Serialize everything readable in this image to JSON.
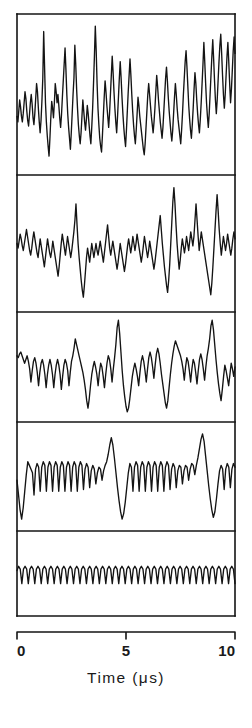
{
  "figure": {
    "background_color": "#ffffff",
    "ink_color": "#141414",
    "plot_left_px": 17,
    "plot_right_px": 235,
    "panel_edges_px": [
      14,
      175,
      312,
      422,
      531,
      616
    ],
    "border_width_px": 1.6,
    "trace_width_px": 1.35
  },
  "axis": {
    "label": "Time (μs)",
    "unit": "μs",
    "quantity": "Time",
    "tick_labels": [
      "0",
      "5",
      "10"
    ],
    "tick_values": [
      0,
      5,
      10
    ],
    "range": [
      0,
      10
    ],
    "axis_line_y_px": 632,
    "tick_direction": "down",
    "tick_length_px": 7,
    "label_y_px": 683
  },
  "panels": [
    {
      "index": 1,
      "name": "panel-1-noisy-broadband",
      "description": "Dense broadband noise with many tall narrow spikes",
      "top_px": 14,
      "bottom_px": 175,
      "baseline_frac": 0.62,
      "spike_count": 26
    },
    {
      "index": 2,
      "name": "panel-2-noisy-with-spikes",
      "description": "Noisy baseline with several prominent upward spikes",
      "top_px": 175,
      "bottom_px": 312,
      "baseline_frac": 0.55,
      "spike_count": 6
    },
    {
      "index": 3,
      "name": "panel-3-semi-periodic",
      "description": "Semi-periodic bursts with sharp downward excursions",
      "top_px": 312,
      "bottom_px": 422,
      "baseline_frac": 0.42,
      "spike_count": 4
    },
    {
      "index": 4,
      "name": "panel-4-comb-with-transients",
      "description": "Regular comb oscillation interrupted by two large transients",
      "top_px": 422,
      "bottom_px": 531,
      "baseline_frac": 0.5,
      "spike_count": 2
    },
    {
      "index": 5,
      "name": "panel-5-regular-comb",
      "description": "Clean uniform periodic comb / sawtooth train",
      "top_px": 531,
      "bottom_px": 616,
      "baseline_frac": 0.5,
      "spike_count": 0
    }
  ],
  "chart_data": {
    "type": "line",
    "title": "",
    "xlabel": "Time (μs)",
    "ylabel": "",
    "xlim": [
      0,
      10
    ],
    "xticks": [
      0,
      5,
      10
    ],
    "xticklabels": [
      "0",
      "5",
      "10"
    ],
    "grid": false,
    "legend": "none",
    "n_panels": 5,
    "panel_layout": "vertical-stack-shared-x",
    "series": [
      {
        "name": "panel 1 — broadband noise",
        "ylim": [
          0,
          1
        ],
        "y": [
          0.34,
          0.3,
          0.38,
          0.46,
          0.41,
          0.34,
          0.3,
          0.36,
          0.44,
          0.52,
          0.47,
          0.38,
          0.31,
          0.27,
          0.35,
          0.44,
          0.5,
          0.43,
          0.33,
          0.28,
          0.36,
          0.47,
          0.58,
          0.52,
          0.4,
          0.3,
          0.22,
          0.31,
          0.45,
          0.62,
          0.96,
          0.7,
          0.44,
          0.3,
          0.2,
          0.12,
          0.05,
          0.18,
          0.33,
          0.45,
          0.4,
          0.33,
          0.44,
          0.58,
          0.52,
          0.44,
          0.5,
          0.42,
          0.33,
          0.26,
          0.35,
          0.48,
          0.6,
          0.72,
          0.84,
          0.68,
          0.5,
          0.36,
          0.26,
          0.18,
          0.1,
          0.22,
          0.36,
          0.5,
          0.62,
          0.86,
          0.72,
          0.54,
          0.4,
          0.28,
          0.2,
          0.14,
          0.22,
          0.34,
          0.46,
          0.38,
          0.3,
          0.24,
          0.32,
          0.42,
          0.36,
          0.28,
          0.2,
          0.14,
          0.26,
          0.4,
          0.58,
          0.78,
          1.0,
          0.82,
          0.58,
          0.4,
          0.28,
          0.18,
          0.12,
          0.08,
          0.2,
          0.34,
          0.48,
          0.6,
          0.52,
          0.42,
          0.34,
          0.26,
          0.36,
          0.5,
          0.64,
          0.78,
          0.66,
          0.52,
          0.4,
          0.3,
          0.22,
          0.34,
          0.48,
          0.62,
          0.74,
          0.62,
          0.48,
          0.36,
          0.26,
          0.18,
          0.12,
          0.24,
          0.38,
          0.52,
          0.64,
          0.76,
          0.64,
          0.5,
          0.38,
          0.28,
          0.2,
          0.14,
          0.24,
          0.36,
          0.48,
          0.42,
          0.34,
          0.28,
          0.22,
          0.16,
          0.1,
          0.06,
          0.14,
          0.26,
          0.38,
          0.5,
          0.58,
          0.5,
          0.42,
          0.34,
          0.28,
          0.22,
          0.3,
          0.4,
          0.52,
          0.64,
          0.56,
          0.46,
          0.38,
          0.3,
          0.24,
          0.18,
          0.26,
          0.38,
          0.5,
          0.62,
          0.7,
          0.6,
          0.48,
          0.38,
          0.3,
          0.22,
          0.16,
          0.24,
          0.36,
          0.48,
          0.58,
          0.5,
          0.4,
          0.32,
          0.26,
          0.2,
          0.14,
          0.24,
          0.36,
          0.5,
          0.62,
          0.74,
          0.82,
          0.7,
          0.56,
          0.42,
          0.32,
          0.24,
          0.18,
          0.28,
          0.4,
          0.54,
          0.66,
          0.58,
          0.46,
          0.36,
          0.28,
          0.22,
          0.32,
          0.44,
          0.58,
          0.72,
          0.88,
          0.74,
          0.58,
          0.44,
          0.34,
          0.26,
          0.36,
          0.5,
          0.64,
          0.78,
          0.9,
          0.76,
          0.6,
          0.46,
          0.36,
          0.46,
          0.6,
          0.74,
          0.86,
          0.94,
          0.8,
          0.64,
          0.5,
          0.4,
          0.5,
          0.64,
          0.78,
          0.88,
          0.74,
          0.58,
          0.44,
          0.54,
          0.68,
          0.82,
          0.92,
          0.8
        ]
      },
      {
        "name": "panel 2 — noisy with spikes",
        "ylim": [
          0,
          1
        ],
        "y": [
          0.5,
          0.46,
          0.52,
          0.58,
          0.54,
          0.48,
          0.44,
          0.5,
          0.56,
          0.62,
          0.56,
          0.5,
          0.44,
          0.4,
          0.46,
          0.54,
          0.6,
          0.54,
          0.48,
          0.42,
          0.38,
          0.46,
          0.54,
          0.48,
          0.42,
          0.36,
          0.3,
          0.38,
          0.46,
          0.54,
          0.48,
          0.42,
          0.38,
          0.44,
          0.52,
          0.46,
          0.4,
          0.34,
          0.28,
          0.22,
          0.3,
          0.4,
          0.5,
          0.58,
          0.52,
          0.46,
          0.4,
          0.48,
          0.56,
          0.5,
          0.44,
          0.38,
          0.44,
          0.52,
          0.6,
          0.7,
          0.84,
          0.66,
          0.5,
          0.38,
          0.28,
          0.18,
          0.1,
          0.04,
          0.14,
          0.26,
          0.38,
          0.46,
          0.4,
          0.34,
          0.42,
          0.5,
          0.44,
          0.38,
          0.44,
          0.5,
          0.44,
          0.4,
          0.46,
          0.52,
          0.46,
          0.4,
          0.34,
          0.42,
          0.5,
          0.58,
          0.66,
          0.56,
          0.46,
          0.4,
          0.46,
          0.52,
          0.46,
          0.4,
          0.34,
          0.28,
          0.34,
          0.42,
          0.5,
          0.44,
          0.38,
          0.32,
          0.26,
          0.32,
          0.4,
          0.48,
          0.54,
          0.48,
          0.42,
          0.48,
          0.56,
          0.5,
          0.44,
          0.5,
          0.58,
          0.52,
          0.46,
          0.4,
          0.34,
          0.4,
          0.48,
          0.56,
          0.5,
          0.44,
          0.38,
          0.44,
          0.52,
          0.46,
          0.4,
          0.34,
          0.28,
          0.34,
          0.42,
          0.5,
          0.58,
          0.66,
          0.74,
          0.62,
          0.5,
          0.4,
          0.3,
          0.22,
          0.14,
          0.08,
          0.18,
          0.32,
          0.5,
          0.68,
          0.86,
          0.98,
          0.84,
          0.66,
          0.5,
          0.38,
          0.28,
          0.36,
          0.46,
          0.54,
          0.48,
          0.42,
          0.48,
          0.56,
          0.5,
          0.44,
          0.52,
          0.6,
          0.54,
          0.48,
          0.56,
          0.7,
          0.84,
          0.7,
          0.56,
          0.44,
          0.52,
          0.6,
          0.54,
          0.48,
          0.42,
          0.36,
          0.3,
          0.24,
          0.18,
          0.12,
          0.06,
          0.16,
          0.3,
          0.46,
          0.62,
          0.78,
          0.92,
          0.78,
          0.62,
          0.5,
          0.4,
          0.48,
          0.56,
          0.5,
          0.44,
          0.5,
          0.58,
          0.52,
          0.46,
          0.4,
          0.46,
          0.54,
          0.6,
          0.54
        ]
      },
      {
        "name": "panel 3 — semi-periodic",
        "ylim": [
          0,
          1
        ],
        "y": [
          0.62,
          0.6,
          0.64,
          0.66,
          0.62,
          0.58,
          0.54,
          0.58,
          0.62,
          0.56,
          0.48,
          0.34,
          0.46,
          0.56,
          0.6,
          0.54,
          0.44,
          0.3,
          0.44,
          0.54,
          0.58,
          0.52,
          0.42,
          0.28,
          0.42,
          0.52,
          0.58,
          0.52,
          0.42,
          0.28,
          0.42,
          0.52,
          0.58,
          0.52,
          0.42,
          0.26,
          0.4,
          0.52,
          0.58,
          0.54,
          0.46,
          0.3,
          0.44,
          0.56,
          0.62,
          0.7,
          0.8,
          0.74,
          0.68,
          0.62,
          0.56,
          0.5,
          0.44,
          0.36,
          0.26,
          0.14,
          0.06,
          0.16,
          0.3,
          0.42,
          0.5,
          0.56,
          0.5,
          0.42,
          0.3,
          0.44,
          0.54,
          0.5,
          0.4,
          0.28,
          0.42,
          0.54,
          0.62,
          0.58,
          0.48,
          0.34,
          0.48,
          0.6,
          0.74,
          0.92,
          1.0,
          0.86,
          0.66,
          0.46,
          0.3,
          0.18,
          0.08,
          0.02,
          0.06,
          0.16,
          0.28,
          0.4,
          0.48,
          0.54,
          0.48,
          0.4,
          0.3,
          0.44,
          0.56,
          0.62,
          0.56,
          0.46,
          0.34,
          0.48,
          0.6,
          0.66,
          0.6,
          0.5,
          0.38,
          0.52,
          0.64,
          0.7,
          0.64,
          0.54,
          0.42,
          0.32,
          0.22,
          0.12,
          0.06,
          0.14,
          0.28,
          0.42,
          0.54,
          0.64,
          0.72,
          0.78,
          0.74,
          0.7,
          0.66,
          0.62,
          0.56,
          0.48,
          0.36,
          0.5,
          0.6,
          0.56,
          0.46,
          0.34,
          0.48,
          0.58,
          0.54,
          0.44,
          0.32,
          0.46,
          0.58,
          0.64,
          0.58,
          0.48,
          0.36,
          0.5,
          0.62,
          0.7,
          0.8,
          0.94,
          1.0,
          0.9,
          0.74,
          0.58,
          0.44,
          0.32,
          0.22,
          0.14,
          0.26,
          0.4,
          0.52,
          0.46,
          0.38,
          0.3,
          0.42,
          0.54,
          0.48,
          0.4,
          0.5
        ]
      },
      {
        "name": "panel 4 — comb with transients",
        "ylim": [
          0,
          1
        ],
        "y": [
          0.46,
          0.3,
          0.14,
          0.04,
          0.16,
          0.34,
          0.52,
          0.66,
          0.62,
          0.58,
          0.54,
          0.3,
          0.58,
          0.64,
          0.6,
          0.34,
          0.6,
          0.66,
          0.62,
          0.34,
          0.6,
          0.66,
          0.62,
          0.34,
          0.6,
          0.66,
          0.62,
          0.34,
          0.6,
          0.66,
          0.62,
          0.34,
          0.6,
          0.66,
          0.62,
          0.34,
          0.6,
          0.66,
          0.62,
          0.34,
          0.6,
          0.66,
          0.62,
          0.36,
          0.58,
          0.64,
          0.6,
          0.38,
          0.56,
          0.62,
          0.58,
          0.42,
          0.54,
          0.6,
          0.58,
          0.46,
          0.56,
          0.62,
          0.66,
          0.74,
          0.84,
          0.92,
          0.84,
          0.7,
          0.54,
          0.38,
          0.24,
          0.12,
          0.04,
          0.1,
          0.22,
          0.38,
          0.54,
          0.64,
          0.6,
          0.34,
          0.6,
          0.66,
          0.62,
          0.34,
          0.6,
          0.66,
          0.62,
          0.34,
          0.6,
          0.66,
          0.62,
          0.34,
          0.6,
          0.66,
          0.62,
          0.34,
          0.6,
          0.66,
          0.62,
          0.34,
          0.6,
          0.66,
          0.62,
          0.36,
          0.58,
          0.64,
          0.6,
          0.38,
          0.56,
          0.62,
          0.6,
          0.42,
          0.56,
          0.62,
          0.6,
          0.46,
          0.58,
          0.64,
          0.62,
          0.52,
          0.62,
          0.7,
          0.8,
          0.9,
          0.96,
          0.88,
          0.72,
          0.56,
          0.4,
          0.26,
          0.14,
          0.06,
          0.12,
          0.26,
          0.42,
          0.56,
          0.62,
          0.58,
          0.36,
          0.58,
          0.64,
          0.6,
          0.38,
          0.58,
          0.64,
          0.6
        ]
      },
      {
        "name": "panel 5 — regular comb",
        "ylim": [
          0,
          1
        ],
        "y": [
          0.54,
          0.6,
          0.56,
          0.36,
          0.56,
          0.6,
          0.56,
          0.36,
          0.56,
          0.6,
          0.56,
          0.36,
          0.56,
          0.6,
          0.56,
          0.36,
          0.56,
          0.6,
          0.56,
          0.36,
          0.56,
          0.6,
          0.56,
          0.36,
          0.56,
          0.6,
          0.56,
          0.36,
          0.56,
          0.6,
          0.56,
          0.36,
          0.56,
          0.6,
          0.56,
          0.36,
          0.56,
          0.6,
          0.56,
          0.36,
          0.56,
          0.6,
          0.56,
          0.36,
          0.56,
          0.6,
          0.56,
          0.36,
          0.56,
          0.6,
          0.56,
          0.36,
          0.56,
          0.6,
          0.56,
          0.36,
          0.56,
          0.6,
          0.56,
          0.36,
          0.56,
          0.6,
          0.56,
          0.36,
          0.56,
          0.6,
          0.56,
          0.36,
          0.56,
          0.6,
          0.56,
          0.36,
          0.56,
          0.6,
          0.56,
          0.36,
          0.56,
          0.6,
          0.56,
          0.36,
          0.56,
          0.6,
          0.56,
          0.36,
          0.56,
          0.6,
          0.56,
          0.36,
          0.56,
          0.6,
          0.56,
          0.36,
          0.56,
          0.6,
          0.56,
          0.36,
          0.56,
          0.6,
          0.56,
          0.36,
          0.56,
          0.6,
          0.56,
          0.36,
          0.56,
          0.6,
          0.56,
          0.36,
          0.56,
          0.6,
          0.56,
          0.36,
          0.56,
          0.6,
          0.56,
          0.36,
          0.56,
          0.6,
          0.56,
          0.36,
          0.56,
          0.6,
          0.56,
          0.36,
          0.56,
          0.6,
          0.56,
          0.36,
          0.56,
          0.6,
          0.56,
          0.36,
          0.56,
          0.6,
          0.56,
          0.36
        ]
      }
    ]
  }
}
